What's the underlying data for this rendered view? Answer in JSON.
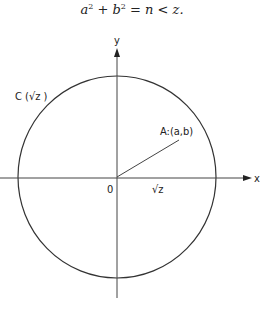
{
  "equation": {
    "a": "a",
    "b": "b",
    "exp": "2",
    "plus": "+",
    "eq": "=",
    "n": "n",
    "lt": "<",
    "z": "z."
  },
  "diagram": {
    "y_axis_label": "y",
    "x_axis_label": "x",
    "origin_label": "0",
    "circle_label": "C (√z )",
    "point_label": "A:(a,b)",
    "radius_label": "√z",
    "colors": {
      "stroke": "#333333",
      "text": "#222222"
    }
  }
}
